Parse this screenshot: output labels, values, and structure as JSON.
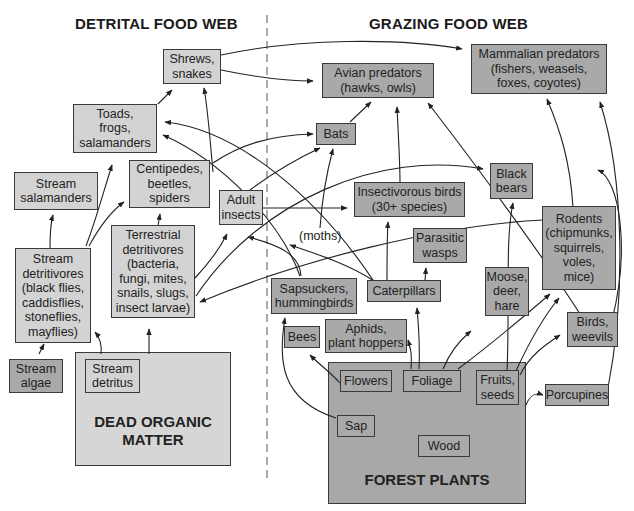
{
  "headers": {
    "detrital": "DETRITAL FOOD WEB",
    "grazing": "GRAZING FOOD WEB"
  },
  "detrital": {
    "shrews_snakes": "Shrews,\nsnakes",
    "toads_frogs": "Toads,\nfrogs,\nsalamanders",
    "centipedes": "Centipedes,\nbeetles,\nspiders",
    "stream_salamanders": "Stream\nsalamanders",
    "adult_insects": "Adult\ninsects",
    "stream_detritivores": "Stream\ndetritivores\n(black flies,\ncaddisflies,\nstoneflies,\nmayflies)",
    "terrestrial_detritivores": "Terrestrial\ndetritivores\n(bacteria,\nfungi, mites,\nsnails, slugs,\ninsect larvae)",
    "stream_algae": "Stream\nalgae",
    "stream_detritus": "Stream\ndetritus",
    "dead_organic_matter": "DEAD ORGANIC\nMATTER"
  },
  "grazing": {
    "mammalian_predators": "Mammalian predators\n(fishers, weasels,\nfoxes, coyotes)",
    "avian_predators": "Avian predators\n(hawks, owls)",
    "bats": "Bats",
    "black_bears": "Black\nbears",
    "insectivorous_birds": "Insectivorous birds\n(30+ species)",
    "moths_label": "(moths)",
    "parasitic_wasps": "Parasitic\nwasps",
    "rodents": "Rodents\n(chipmunks,\nsquirrels,\nvoles,\nmice)",
    "sapsuckers": "Sapsuckers,\nhummingbirds",
    "caterpillars": "Caterpillars",
    "moose_deer": "Moose,\ndeer,\nhare",
    "bees": "Bees",
    "aphids": "Aphids,\nplant hoppers",
    "birds_weevils": "Birds,\nweevils",
    "flowers": "Flowers",
    "foliage": "Foliage",
    "fruits_seeds": "Fruits,\nseeds",
    "porcupines": "Porcupines",
    "sap": "Sap",
    "wood": "Wood",
    "forest_plants": "FOREST PLANTS"
  },
  "colors": {
    "detrital_box": "#d3d3d3",
    "grazing_box": "#a9a9a9",
    "divider": "#aaaaaa",
    "arrow": "#222222"
  }
}
